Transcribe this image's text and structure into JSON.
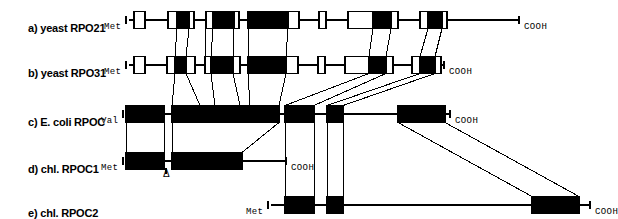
{
  "figure": {
    "background": "#ffffff",
    "ink": "#000000",
    "width": 606,
    "height": 217
  },
  "rows": [
    {
      "id": "a",
      "label": "a) yeast RPO21",
      "n_terminus": "Met",
      "c_terminus": "COOH",
      "baseline_y": 20
    },
    {
      "id": "b",
      "label": "b) yeast RPO31",
      "n_terminus": "Met",
      "c_terminus": "COOH",
      "baseline_y": 65
    },
    {
      "id": "c",
      "label": "c) E. coli RPOC",
      "n_terminus": "Val",
      "c_terminus": "COOH",
      "baseline_y": 114
    },
    {
      "id": "d",
      "label": "d) chl. RPOC1",
      "n_terminus": "Met",
      "c_terminus": "COOH",
      "baseline_y": 161
    },
    {
      "id": "e",
      "label": "e) chl. RPOC2",
      "n_terminus": "Met",
      "c_terminus": "COOH",
      "baseline_y": 205
    }
  ],
  "annotations": {
    "deletion_marker": "Δ"
  },
  "chart_data": {
    "type": "diagram",
    "row_a": {
      "line": {
        "x1": 129,
        "x2": 519
      },
      "n_tick_x": 126,
      "c_tick_x": 519,
      "boxes": [
        {
          "x": 134,
          "w": 11,
          "fill": "open"
        },
        {
          "x": 168,
          "w": 9,
          "fill": "open"
        },
        {
          "x": 177,
          "w": 12,
          "fill": "black"
        },
        {
          "x": 189,
          "w": 5,
          "fill": "open"
        },
        {
          "x": 206,
          "w": 7,
          "fill": "open"
        },
        {
          "x": 213,
          "w": 21,
          "fill": "black"
        },
        {
          "x": 234,
          "w": 5,
          "fill": "open"
        },
        {
          "x": 248,
          "w": 40,
          "fill": "black"
        },
        {
          "x": 288,
          "w": 11,
          "fill": "open"
        },
        {
          "x": 319,
          "w": 7,
          "fill": "open"
        },
        {
          "x": 348,
          "w": 25,
          "fill": "open"
        },
        {
          "x": 373,
          "w": 18,
          "fill": "black"
        },
        {
          "x": 391,
          "w": 7,
          "fill": "open"
        },
        {
          "x": 420,
          "w": 8,
          "fill": "open"
        },
        {
          "x": 428,
          "w": 14,
          "fill": "black"
        },
        {
          "x": 442,
          "w": 5,
          "fill": "open"
        }
      ]
    },
    "row_b": {
      "line": {
        "x1": 129,
        "x2": 444
      },
      "n_tick_x": 126,
      "c_tick_x": 444,
      "boxes": [
        {
          "x": 134,
          "w": 11,
          "fill": "open"
        },
        {
          "x": 167,
          "w": 8,
          "fill": "open"
        },
        {
          "x": 175,
          "w": 11,
          "fill": "black"
        },
        {
          "x": 186,
          "w": 9,
          "fill": "open"
        },
        {
          "x": 205,
          "w": 6,
          "fill": "open"
        },
        {
          "x": 211,
          "w": 22,
          "fill": "black"
        },
        {
          "x": 233,
          "w": 7,
          "fill": "open"
        },
        {
          "x": 248,
          "w": 38,
          "fill": "black"
        },
        {
          "x": 286,
          "w": 12,
          "fill": "open"
        },
        {
          "x": 318,
          "w": 7,
          "fill": "open"
        },
        {
          "x": 345,
          "w": 24,
          "fill": "open"
        },
        {
          "x": 369,
          "w": 17,
          "fill": "black"
        },
        {
          "x": 386,
          "w": 7,
          "fill": "open"
        },
        {
          "x": 412,
          "w": 8,
          "fill": "open"
        },
        {
          "x": 420,
          "w": 15,
          "fill": "black"
        },
        {
          "x": 435,
          "w": 6,
          "fill": "open"
        }
      ]
    },
    "row_c": {
      "line": {
        "x1": 126,
        "x2": 450
      },
      "n_tick_x": 123,
      "c_tick_x": 450,
      "boxes": [
        {
          "x": 126,
          "w": 38,
          "fill": "black"
        },
        {
          "x": 172,
          "w": 107,
          "fill": "black"
        },
        {
          "x": 285,
          "w": 29,
          "fill": "black"
        },
        {
          "x": 327,
          "w": 16,
          "fill": "black"
        },
        {
          "x": 398,
          "w": 47,
          "fill": "black"
        }
      ]
    },
    "row_d": {
      "line": {
        "x1": 126,
        "x2": 286
      },
      "n_tick_x": 123,
      "c_tick_x": 286,
      "boxes": [
        {
          "x": 126,
          "w": 38,
          "fill": "black"
        },
        {
          "x": 172,
          "w": 70,
          "fill": "black"
        }
      ],
      "deletion_x": 166
    },
    "row_e": {
      "line": {
        "x1": 271,
        "x2": 590
      },
      "n_tick_x": 268,
      "c_tick_x": 590,
      "boxes": [
        {
          "x": 285,
          "w": 29,
          "fill": "black"
        },
        {
          "x": 327,
          "w": 16,
          "fill": "black"
        },
        {
          "x": 532,
          "w": 47,
          "fill": "black"
        }
      ]
    },
    "connectors": {
      "a_to_b": [
        [
          177,
          175
        ],
        [
          189,
          186
        ],
        [
          206,
          205
        ],
        [
          213,
          211
        ],
        [
          234,
          233
        ],
        [
          248,
          248
        ],
        [
          288,
          286
        ],
        [
          373,
          369
        ],
        [
          391,
          386
        ],
        [
          428,
          420
        ],
        [
          442,
          435
        ]
      ],
      "b_to_c": [
        [
          175,
          172
        ],
        [
          186,
          200
        ],
        [
          211,
          215
        ],
        [
          233,
          240
        ],
        [
          248,
          250
        ],
        [
          286,
          279
        ],
        [
          369,
          285
        ],
        [
          386,
          314
        ],
        [
          420,
          327
        ],
        [
          435,
          343
        ]
      ],
      "c_to_d": [
        [
          126,
          126
        ],
        [
          164,
          164
        ],
        [
          172,
          172
        ],
        [
          279,
          242
        ]
      ],
      "c_to_e": [
        [
          285,
          285
        ],
        [
          314,
          314
        ],
        [
          327,
          327
        ],
        [
          343,
          343
        ],
        [
          398,
          532
        ],
        [
          445,
          579
        ]
      ]
    }
  }
}
